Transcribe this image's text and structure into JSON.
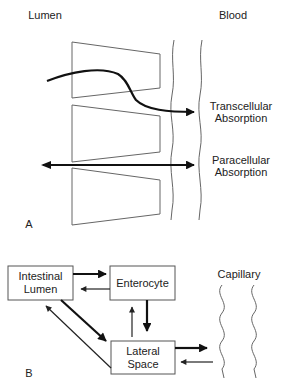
{
  "panel_a": {
    "label": "A",
    "left_heading": "Lumen",
    "right_heading": "Blood",
    "transcellular": {
      "line1": "Transcellular",
      "line2": "Absorption"
    },
    "paracellular": {
      "line1": "Paracellular",
      "line2": "Absorption"
    }
  },
  "panel_b": {
    "label": "B",
    "boxes": {
      "intestinal_lumen": {
        "line1": "Intestinal",
        "line2": "Lumen"
      },
      "enterocyte": {
        "line1": "Enterocyte"
      },
      "lateral_space": {
        "line1": "Lateral",
        "line2": "Space"
      }
    },
    "capillary": "Capillary"
  },
  "colors": {
    "stroke": "#666666",
    "arrow": "#111111",
    "text": "#222222"
  }
}
